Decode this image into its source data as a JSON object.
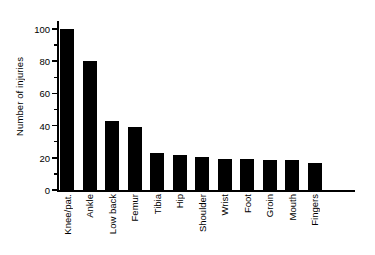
{
  "chart_data": {
    "type": "bar",
    "title": "",
    "xlabel": "",
    "ylabel": "Number of injuries",
    "categories": [
      "Knee/pat.",
      "Ankle",
      "Low back",
      "Femur",
      "Tibia",
      "Hip",
      "Shoulder",
      "Wrist",
      "Foot",
      "Groin",
      "Mouth",
      "Fingers"
    ],
    "values": [
      100,
      80,
      43,
      39,
      23,
      22,
      20.5,
      19,
      19,
      18.5,
      18.5,
      17
    ],
    "ylim": [
      0,
      105
    ],
    "yticks_major": [
      0,
      20,
      40,
      60,
      80,
      100
    ],
    "ytick_labels": [
      "0",
      "20",
      "40",
      "60",
      "80",
      "100"
    ],
    "yticks_minor": [
      10,
      30,
      50,
      70,
      90
    ],
    "grid": false,
    "legend": null,
    "bar_color": "#000000",
    "background": "#ffffff"
  },
  "axes": {
    "y_title": "Number of injuries",
    "y_tick_labels": [
      "0",
      "20",
      "40",
      "60",
      "80",
      "100"
    ],
    "x_tick_labels": [
      "Knee/pat.",
      "Ankle",
      "Low back",
      "Femur",
      "Tibia",
      "Hip",
      "Shoulder",
      "Wrist",
      "Foot",
      "Groin",
      "Mouth",
      "Fingers"
    ]
  }
}
